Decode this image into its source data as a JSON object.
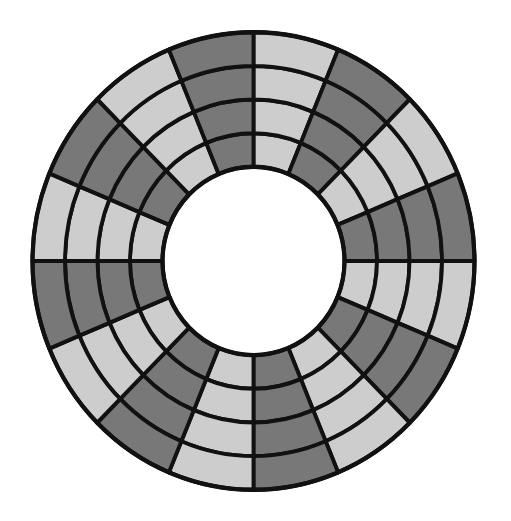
{
  "diagram": {
    "type": "segmented-ring",
    "sectors": 16,
    "rings": 4,
    "start_angle_deg": 0,
    "direction": "clockwise-from-top",
    "sector_pattern": [
      "light",
      "dark",
      "light",
      "dark",
      "light",
      "dark",
      "light",
      "dark",
      "light",
      "dark",
      "light",
      "dark",
      "light",
      "dark",
      "light",
      "dark"
    ],
    "colors": {
      "light": "#cdcdcd",
      "dark": "#787878",
      "stroke": "#111111",
      "background": "#ffffff"
    },
    "geometry": {
      "center_x": 253.5,
      "center_y": 261,
      "outer_radius": 221,
      "inner_radius": 91,
      "vertical_scale": 1.035,
      "stroke_width": 4
    }
  }
}
